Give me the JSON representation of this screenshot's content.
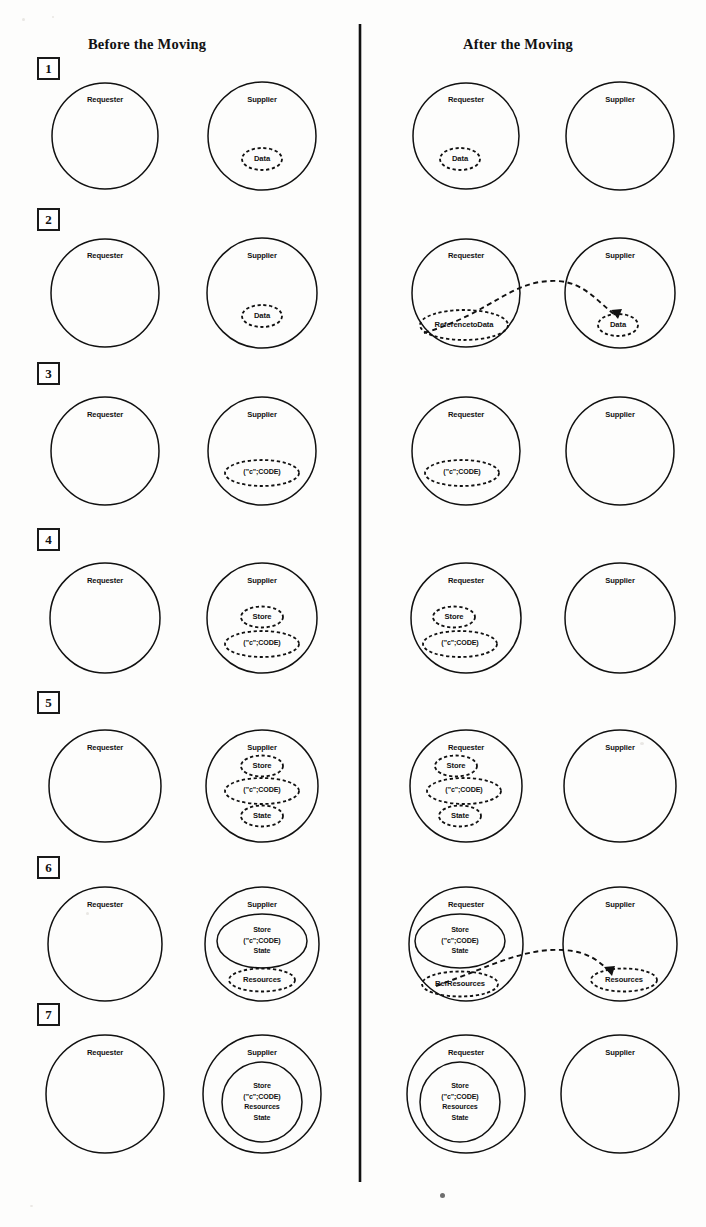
{
  "page": {
    "width": 706,
    "height": 1227,
    "background": "#fdfdfc",
    "ink": "#111111"
  },
  "headers": {
    "left": "Before the Moving",
    "right": "After the Moving"
  },
  "divider": {
    "x": 360,
    "y_top": 24,
    "y_bottom": 1182
  },
  "row_numbers": [
    "1",
    "2",
    "3",
    "4",
    "5",
    "6",
    "7"
  ],
  "entity_labels": {
    "requester": "Requester",
    "supplier": "Supplier"
  },
  "item_labels": {
    "data": "Data",
    "reference_to_data": "ReferencetoData",
    "code": "(\"c\";CODE)",
    "store": "Store",
    "state": "State",
    "resources": "Resources",
    "ref_resources": "RefResources"
  },
  "rows": [
    {
      "number": "1",
      "before": {
        "requester": {
          "label": "Requester",
          "items": []
        },
        "supplier": {
          "label": "Supplier",
          "items": [
            {
              "text": "Data",
              "style": "dashed"
            }
          ]
        }
      },
      "after": {
        "requester": {
          "label": "Requester",
          "items": [
            {
              "text": "Data",
              "style": "dashed"
            }
          ]
        },
        "supplier": {
          "label": "Supplier",
          "items": []
        }
      },
      "link": null
    },
    {
      "number": "2",
      "before": {
        "requester": {
          "label": "Requester",
          "items": []
        },
        "supplier": {
          "label": "Supplier",
          "items": [
            {
              "text": "Data",
              "style": "dashed"
            }
          ]
        }
      },
      "after": {
        "requester": {
          "label": "Requester",
          "items": [
            {
              "text": "ReferencetoData",
              "style": "dashed"
            }
          ]
        },
        "supplier": {
          "label": "Supplier",
          "items": [
            {
              "text": "Data",
              "style": "dashed"
            }
          ]
        }
      },
      "link": {
        "from": "ReferencetoData",
        "to": "Data",
        "style": "dashed-arrow"
      }
    },
    {
      "number": "3",
      "before": {
        "requester": {
          "label": "Requester",
          "items": []
        },
        "supplier": {
          "label": "Supplier",
          "items": [
            {
              "text": "(\"c\";CODE)",
              "style": "dashed"
            }
          ]
        }
      },
      "after": {
        "requester": {
          "label": "Requester",
          "items": [
            {
              "text": "(\"c\";CODE)",
              "style": "dashed"
            }
          ]
        },
        "supplier": {
          "label": "Supplier",
          "items": []
        }
      },
      "link": null
    },
    {
      "number": "4",
      "before": {
        "requester": {
          "label": "Requester",
          "items": []
        },
        "supplier": {
          "label": "Supplier",
          "items": [
            {
              "text": "Store",
              "style": "dashed"
            },
            {
              "text": "(\"c\";CODE)",
              "style": "dashed"
            }
          ]
        }
      },
      "after": {
        "requester": {
          "label": "Requester",
          "items": [
            {
              "text": "Store",
              "style": "dashed"
            },
            {
              "text": "(\"c\";CODE)",
              "style": "dashed"
            }
          ]
        },
        "supplier": {
          "label": "Supplier",
          "items": []
        }
      },
      "link": null
    },
    {
      "number": "5",
      "before": {
        "requester": {
          "label": "Requester",
          "items": []
        },
        "supplier": {
          "label": "Supplier",
          "items": [
            {
              "text": "Store",
              "style": "dashed"
            },
            {
              "text": "(\"c\";CODE)",
              "style": "dashed"
            },
            {
              "text": "State",
              "style": "dashed"
            }
          ]
        }
      },
      "after": {
        "requester": {
          "label": "Requester",
          "items": [
            {
              "text": "Store",
              "style": "dashed"
            },
            {
              "text": "(\"c\";CODE)",
              "style": "dashed"
            },
            {
              "text": "State",
              "style": "dashed"
            }
          ]
        },
        "supplier": {
          "label": "Supplier",
          "items": []
        }
      },
      "link": null
    },
    {
      "number": "6",
      "before": {
        "requester": {
          "label": "Requester",
          "items": []
        },
        "supplier": {
          "label": "Supplier",
          "items": [
            {
              "text": "Store\n(\"c\";CODE)\nState",
              "style": "solid"
            },
            {
              "text": "Resources",
              "style": "dashed"
            }
          ]
        }
      },
      "after": {
        "requester": {
          "label": "Requester",
          "items": [
            {
              "text": "Store\n(\"c\";CODE)\nState",
              "style": "solid"
            },
            {
              "text": "RefResources",
              "style": "dashed"
            }
          ]
        },
        "supplier": {
          "label": "Supplier",
          "items": [
            {
              "text": "Resources",
              "style": "dashed"
            }
          ]
        }
      },
      "link": {
        "from": "RefResources",
        "to": "Resources",
        "style": "dashed-arrow"
      }
    },
    {
      "number": "7",
      "before": {
        "requester": {
          "label": "Requester",
          "items": []
        },
        "supplier": {
          "label": "Supplier",
          "items": [
            {
              "text": "Store\n(\"c\";CODE)\nResources\nState",
              "style": "solid"
            }
          ]
        }
      },
      "after": {
        "requester": {
          "label": "Requester",
          "items": [
            {
              "text": "Store\n(\"c\";CODE)\nResources\nState",
              "style": "solid"
            }
          ]
        },
        "supplier": {
          "label": "Supplier",
          "items": []
        }
      },
      "link": null
    }
  ]
}
